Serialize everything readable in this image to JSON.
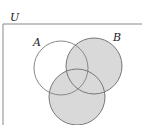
{
  "diagram": {
    "type": "venn",
    "universe_label": "U",
    "sets": [
      {
        "label": "A",
        "shaded": false
      },
      {
        "label": "B",
        "shaded": true
      },
      {
        "label": "C",
        "shaded": true,
        "label_visible": false
      }
    ],
    "shaded_region": "B ∪ C",
    "colors": {
      "shade": "#d9d9d9",
      "stroke": "#777777",
      "border": "#888888"
    }
  }
}
